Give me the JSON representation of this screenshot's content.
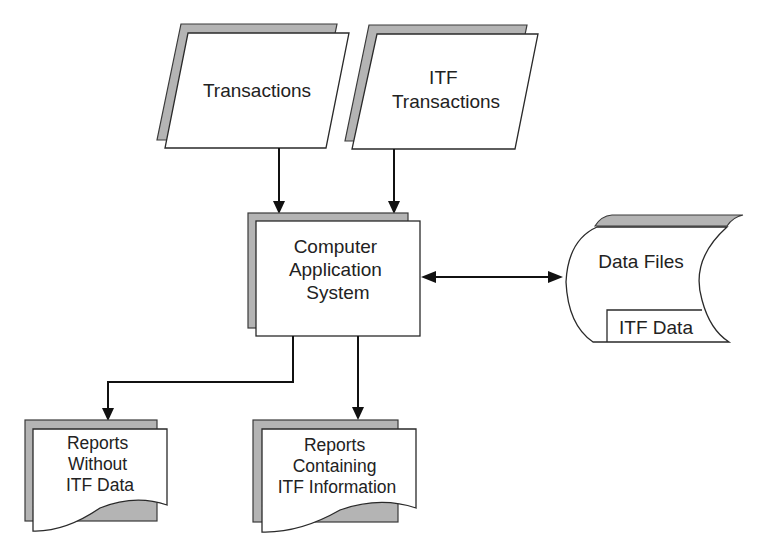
{
  "diagram": {
    "type": "flowchart",
    "title": "",
    "nodes": {
      "transactions": {
        "shape": "parallelogram",
        "label_lines": [
          "Transactions"
        ]
      },
      "itf_transactions": {
        "shape": "parallelogram",
        "label_lines": [
          "ITF",
          "Transactions"
        ]
      },
      "computer_app": {
        "shape": "process",
        "label_lines": [
          "Computer",
          "Application",
          "System"
        ]
      },
      "data_files": {
        "shape": "stored-data",
        "label_lines": [
          "Data Files"
        ],
        "inner_label": "ITF Data"
      },
      "reports_without": {
        "shape": "document",
        "label_lines": [
          "Reports",
          "Without",
          "ITF Data"
        ]
      },
      "reports_containing": {
        "shape": "document",
        "label_lines": [
          "Reports",
          "Containing",
          "ITF Information"
        ]
      }
    },
    "edges": [
      {
        "from": "transactions",
        "to": "computer_app",
        "direction": "one-way"
      },
      {
        "from": "itf_transactions",
        "to": "computer_app",
        "direction": "one-way"
      },
      {
        "from": "computer_app",
        "to": "data_files",
        "direction": "two-way"
      },
      {
        "from": "computer_app",
        "to": "reports_without",
        "direction": "one-way"
      },
      {
        "from": "computer_app",
        "to": "reports_containing",
        "direction": "one-way"
      }
    ],
    "colors": {
      "shadow": "#b4b4b4",
      "outline": "#2a2a2a",
      "fill": "#ffffff",
      "text": "#222222"
    }
  }
}
